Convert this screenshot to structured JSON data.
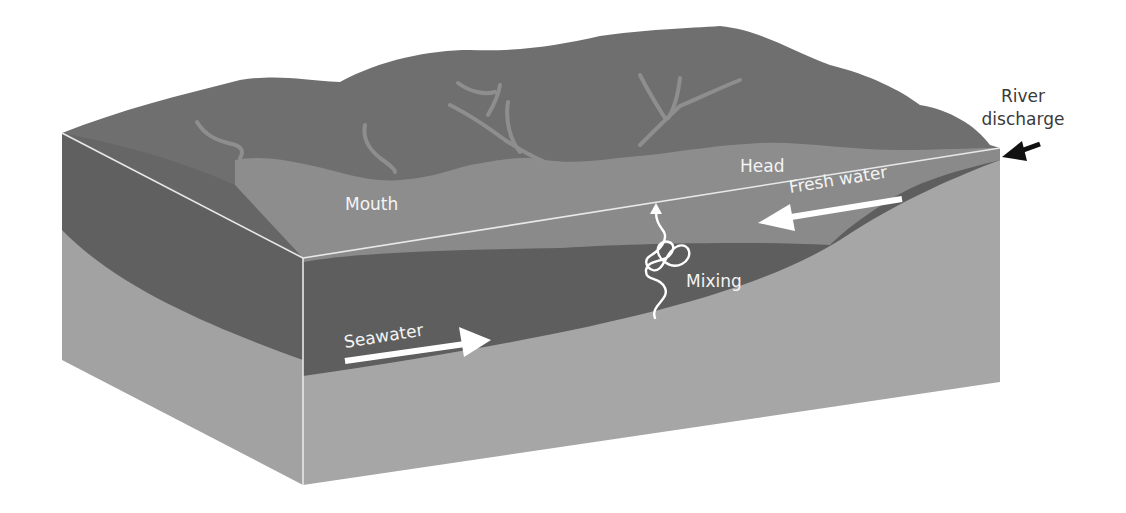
{
  "diagram": {
    "labels": {
      "river_discharge_line1": "River",
      "river_discharge_line2": "discharge",
      "mouth": "Mouth",
      "head": "Head",
      "fresh_water": "Fresh water",
      "mixing": "Mixing",
      "seawater": "Seawater"
    },
    "colors": {
      "land": "#6e6e6e",
      "estuary_surface": "#8c8c8c",
      "fresh_water_layer": "#8a8a8a",
      "seawater_layer": "#5f5f5f",
      "sediment": "#a4a4a4",
      "box_edge": "#e8e8e8",
      "label_light": "#f4f4f4",
      "label_dark": "#3a3a3a",
      "arrow_black": "#111111"
    }
  }
}
